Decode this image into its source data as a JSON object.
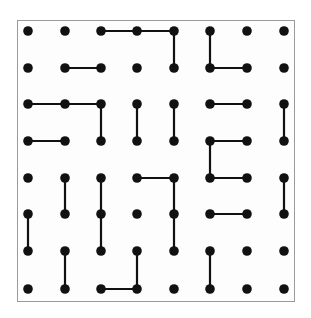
{
  "puzzle": {
    "type": "dot-grid",
    "cols": 8,
    "rows": 8,
    "colors": {
      "dot": "#111111",
      "line": "#111111",
      "border": "#9a9a9a",
      "background": "#ffffff"
    },
    "dot_x": [
      28,
      65,
      101,
      137,
      174,
      210,
      247,
      284
    ],
    "dot_y": [
      31,
      68,
      104,
      141,
      178,
      214,
      251,
      289
    ],
    "segments": [
      [
        [
          2,
          0
        ],
        [
          3,
          0
        ]
      ],
      [
        [
          3,
          0
        ],
        [
          4,
          0
        ]
      ],
      [
        [
          4,
          0
        ],
        [
          4,
          1
        ]
      ],
      [
        [
          5,
          0
        ],
        [
          5,
          1
        ]
      ],
      [
        [
          1,
          1
        ],
        [
          2,
          1
        ]
      ],
      [
        [
          5,
          1
        ],
        [
          6,
          1
        ]
      ],
      [
        [
          0,
          2
        ],
        [
          1,
          2
        ]
      ],
      [
        [
          1,
          2
        ],
        [
          2,
          2
        ]
      ],
      [
        [
          2,
          2
        ],
        [
          2,
          3
        ]
      ],
      [
        [
          3,
          2
        ],
        [
          3,
          3
        ]
      ],
      [
        [
          4,
          2
        ],
        [
          4,
          3
        ]
      ],
      [
        [
          5,
          2
        ],
        [
          6,
          2
        ]
      ],
      [
        [
          7,
          2
        ],
        [
          7,
          3
        ]
      ],
      [
        [
          0,
          3
        ],
        [
          1,
          3
        ]
      ],
      [
        [
          5,
          3
        ],
        [
          6,
          3
        ]
      ],
      [
        [
          5,
          3
        ],
        [
          5,
          4
        ]
      ],
      [
        [
          3,
          4
        ],
        [
          4,
          4
        ]
      ],
      [
        [
          4,
          4
        ],
        [
          4,
          5
        ]
      ],
      [
        [
          5,
          4
        ],
        [
          6,
          4
        ]
      ],
      [
        [
          1,
          4
        ],
        [
          1,
          5
        ]
      ],
      [
        [
          2,
          4
        ],
        [
          2,
          5
        ]
      ],
      [
        [
          7,
          4
        ],
        [
          7,
          5
        ]
      ],
      [
        [
          0,
          5
        ],
        [
          0,
          6
        ]
      ],
      [
        [
          2,
          5
        ],
        [
          2,
          6
        ]
      ],
      [
        [
          4,
          5
        ],
        [
          4,
          6
        ]
      ],
      [
        [
          5,
          5
        ],
        [
          6,
          5
        ]
      ],
      [
        [
          1,
          6
        ],
        [
          1,
          7
        ]
      ],
      [
        [
          3,
          6
        ],
        [
          3,
          7
        ]
      ],
      [
        [
          5,
          6
        ],
        [
          5,
          7
        ]
      ],
      [
        [
          2,
          7
        ],
        [
          3,
          7
        ]
      ]
    ]
  }
}
